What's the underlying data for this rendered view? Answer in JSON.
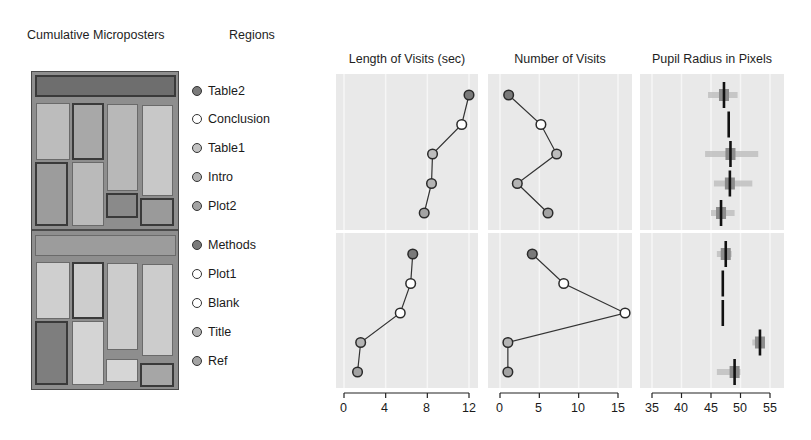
{
  "headers": {
    "cumulative": "Cumulative Microposters",
    "regions": "Regions"
  },
  "legend": [
    {
      "label": "Table2",
      "color": "#7a7a7a"
    },
    {
      "label": "Conclusion",
      "color": "#ffffff"
    },
    {
      "label": "Table1",
      "color": "#bdbdbd"
    },
    {
      "label": "Intro",
      "color": "#b4b4b4"
    },
    {
      "label": "Plot2",
      "color": "#a3a3a3"
    },
    {
      "label": "Methods",
      "color": "#7a7a7a"
    },
    {
      "label": "Plot1",
      "color": "#ffffff"
    },
    {
      "label": "Blank",
      "color": "#ffffff"
    },
    {
      "label": "Title",
      "color": "#b4b4b4"
    },
    {
      "label": "Ref",
      "color": "#a3a3a3"
    }
  ],
  "chart_data": [
    {
      "type": "line",
      "title": "Length of Visits (sec)",
      "xlabel": "",
      "ylabel": "",
      "xlim": [
        0,
        12
      ],
      "xticks": [
        0,
        4,
        8,
        12
      ],
      "grid": true,
      "groups": [
        {
          "categories": [
            "Table2",
            "Conclusion",
            "Table1",
            "Intro",
            "Plot2"
          ],
          "values": [
            12.0,
            11.3,
            8.5,
            8.4,
            7.7
          ]
        },
        {
          "categories": [
            "Methods",
            "Plot1",
            "Blank",
            "Title",
            "Ref"
          ],
          "values": [
            6.6,
            6.4,
            5.4,
            1.6,
            1.3
          ]
        }
      ]
    },
    {
      "type": "line",
      "title": "Number of Visits",
      "xlabel": "",
      "ylabel": "",
      "xlim": [
        0,
        15
      ],
      "xticks": [
        0,
        5,
        10,
        15
      ],
      "grid": true,
      "groups": [
        {
          "categories": [
            "Table2",
            "Conclusion",
            "Table1",
            "Intro",
            "Plot2"
          ],
          "values": [
            1.1,
            5.2,
            7.2,
            2.2,
            6.1
          ]
        },
        {
          "categories": [
            "Methods",
            "Plot1",
            "Blank",
            "Title",
            "Ref"
          ],
          "values": [
            4.1,
            8.1,
            15.9,
            1.0,
            1.0
          ]
        }
      ]
    },
    {
      "type": "box",
      "title": "Pupil Radius in Pixels",
      "xlabel": "",
      "ylabel": "",
      "xlim": [
        35,
        55
      ],
      "xticks": [
        35,
        40,
        45,
        50,
        55
      ],
      "grid": true,
      "groups": [
        {
          "categories": [
            "Table2",
            "Conclusion",
            "Table1",
            "Intro",
            "Plot2"
          ],
          "medians": [
            47.2,
            48.0,
            48.3,
            48.2,
            46.7
          ],
          "spread": [
            [
              44.5,
              49.5
            ],
            [
              48.0,
              48.0
            ],
            [
              44.0,
              53.0
            ],
            [
              45.5,
              52.0
            ],
            [
              45.0,
              49.0
            ]
          ]
        },
        {
          "categories": [
            "Methods",
            "Plot1",
            "Blank",
            "Title",
            "Ref"
          ],
          "medians": [
            47.5,
            47.0,
            47.0,
            53.3,
            49.0
          ],
          "spread": [
            [
              46.0,
              48.5
            ],
            [
              47.0,
              47.0
            ],
            [
              47.0,
              47.0
            ],
            [
              52.0,
              54.0
            ],
            [
              46.0,
              50.0
            ]
          ]
        }
      ]
    }
  ],
  "axis_labels": {
    "length": [
      "0",
      "4",
      "8",
      "12"
    ],
    "number": [
      "0",
      "5",
      "10",
      "15"
    ],
    "pupil": [
      "35",
      "40",
      "45",
      "50",
      "55"
    ]
  }
}
